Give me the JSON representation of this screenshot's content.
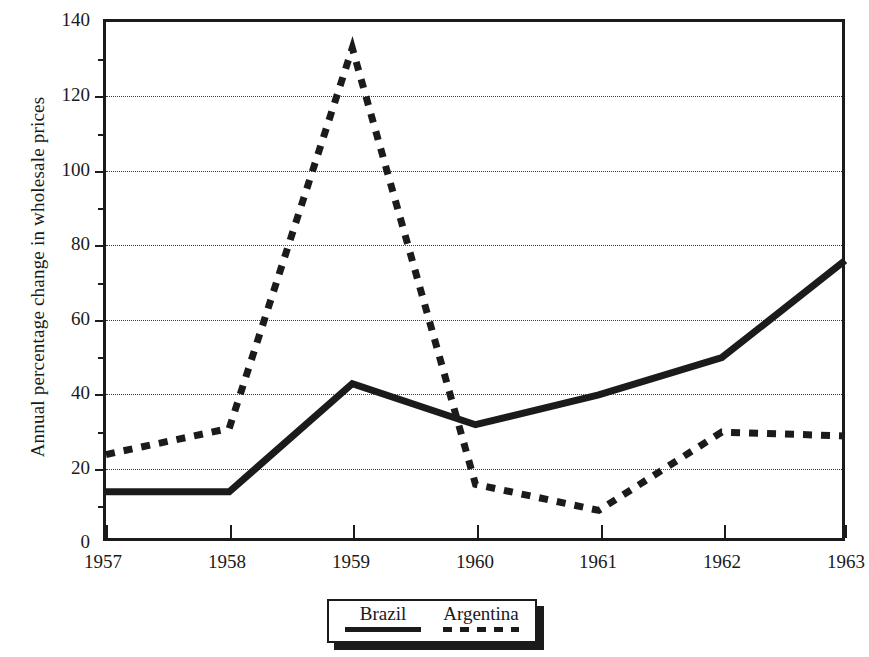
{
  "chart_data": {
    "type": "line",
    "title": "",
    "xlabel": "",
    "ylabel": "Annual percentage change in wholesale prices",
    "categories": [
      "1957",
      "1958",
      "1959",
      "1960",
      "1961",
      "1962",
      "1963"
    ],
    "x": [
      1957,
      1958,
      1959,
      1960,
      1961,
      1962,
      1963
    ],
    "series": [
      {
        "name": "Brazil",
        "style": "solid",
        "color": "#1b1b1b",
        "values": [
          14,
          14,
          43,
          32,
          40,
          50,
          76
        ]
      },
      {
        "name": "Argentina",
        "style": "dashed",
        "color": "#1b1b1b",
        "values": [
          24,
          31,
          133,
          16,
          9,
          30,
          29
        ]
      }
    ],
    "ylim": [
      0,
      140
    ],
    "xlim": [
      1957,
      1963
    ],
    "yticks": [
      0,
      20,
      40,
      60,
      80,
      100,
      120,
      140
    ],
    "ytick_labels": [
      "0",
      "20",
      "40",
      "60",
      "80",
      "100",
      "120",
      "140"
    ],
    "yminor_ticks": [
      10,
      30,
      50,
      70,
      90,
      110,
      130
    ],
    "grid": "horizontal-dotted",
    "gridlines": [
      20,
      40,
      60,
      80,
      100,
      120
    ],
    "legend_position": "below-center",
    "legend_entries": [
      "Brazil",
      "Argentina"
    ]
  },
  "axes": {
    "y_title": "Annual percentage change in wholesale prices",
    "y_tick_labels": [
      "140",
      "120",
      "100",
      "80",
      "60",
      "40",
      "20",
      "0"
    ],
    "x_tick_labels": [
      "1957",
      "1958",
      "1959",
      "1960",
      "1961",
      "1962",
      "1963"
    ]
  },
  "legend": {
    "entries": [
      {
        "label": "Brazil",
        "style": "solid"
      },
      {
        "label": "Argentina",
        "style": "dashed"
      }
    ]
  }
}
